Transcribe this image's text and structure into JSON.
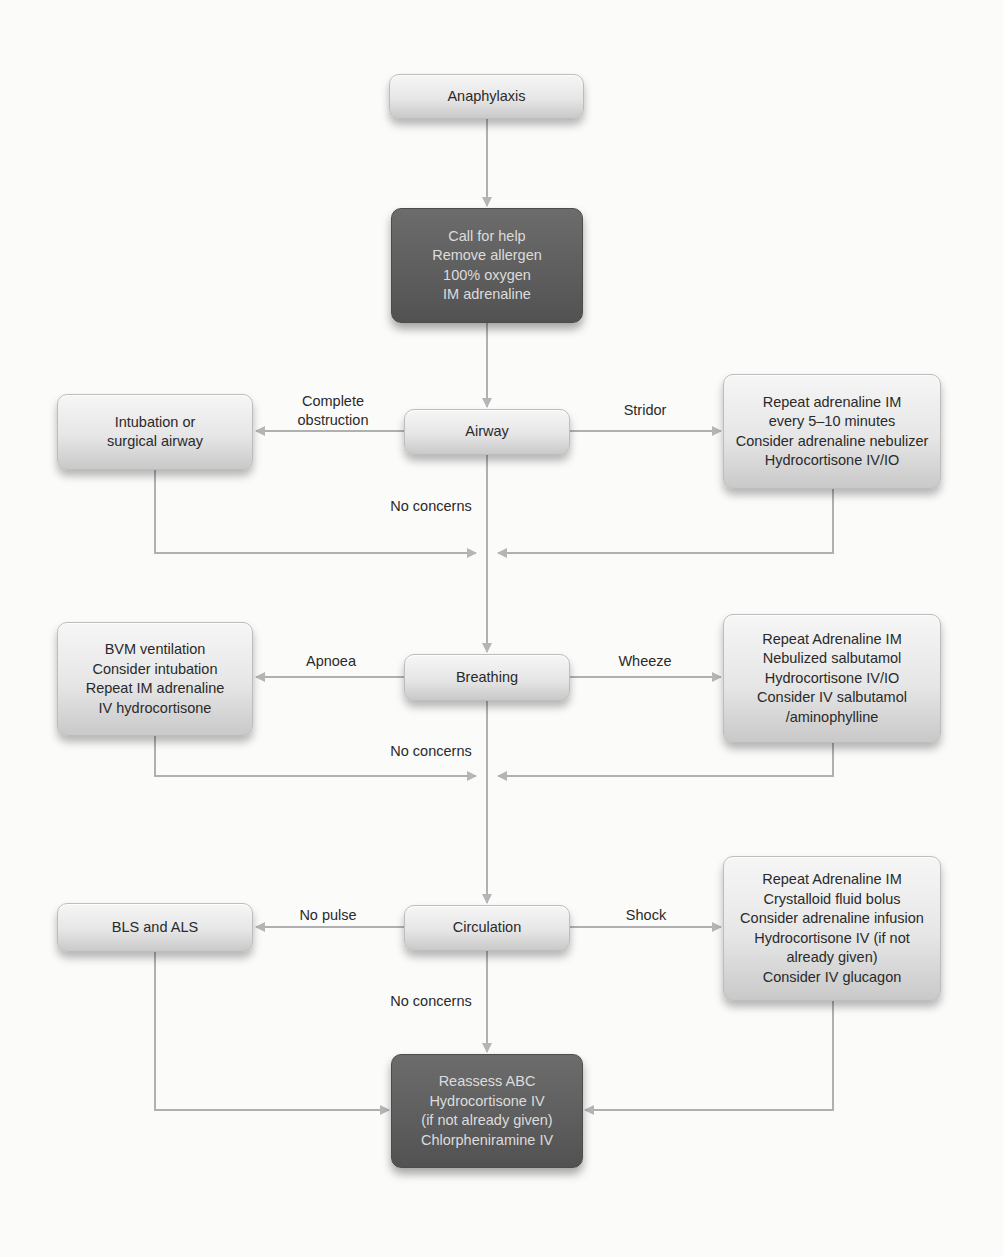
{
  "diagram": {
    "colors": {
      "light_box": "#e6e6e6",
      "dark_box": "#5d5d5d",
      "connector": "#b0b0b0",
      "text_dark": "#2a2a2a",
      "text_light": "#dcdcdc"
    },
    "nodes": {
      "anaphylaxis": {
        "lines": [
          "Anaphylaxis"
        ]
      },
      "initial": {
        "lines": [
          "Call for help",
          "Remove allergen",
          "100% oxygen",
          "IM adrenaline"
        ]
      },
      "airway": {
        "lines": [
          "Airway"
        ]
      },
      "intubation": {
        "lines": [
          "Intubation or",
          "surgical airway"
        ]
      },
      "stridor_tx": {
        "lines": [
          "Repeat adrenaline IM",
          "every 5–10 minutes",
          "Consider adrenaline nebulizer",
          "Hydrocortisone IV/IO"
        ]
      },
      "breathing": {
        "lines": [
          "Breathing"
        ]
      },
      "apnoea_tx": {
        "lines": [
          "BVM ventilation",
          "Consider intubation",
          "Repeat IM adrenaline",
          "IV hydrocortisone"
        ]
      },
      "wheeze_tx": {
        "lines": [
          "Repeat Adrenaline IM",
          "Nebulized salbutamol",
          "Hydrocortisone IV/IO",
          "Consider IV salbutamol",
          "/aminophylline"
        ]
      },
      "circulation": {
        "lines": [
          "Circulation"
        ]
      },
      "nopulse_tx": {
        "lines": [
          "BLS and ALS"
        ]
      },
      "shock_tx": {
        "lines": [
          "Repeat Adrenaline IM",
          "Crystalloid fluid bolus",
          "Consider adrenaline infusion",
          "Hydrocortisone IV (if not",
          "already given)",
          "Consider IV glucagon"
        ]
      },
      "reassess": {
        "lines": [
          "Reassess ABC",
          "Hydrocortisone IV",
          "(if not already given)",
          "Chlorpheniramine IV"
        ]
      }
    },
    "edge_labels": {
      "complete_obstruction": [
        "Complete",
        "obstruction"
      ],
      "stridor": "Stridor",
      "airway_no_concerns": "No concerns",
      "apnoea": "Apnoea",
      "wheeze": "Wheeze",
      "breathing_no_concerns": "No concerns",
      "no_pulse": "No pulse",
      "shock": "Shock",
      "circulation_no_concerns": "No concerns"
    }
  }
}
